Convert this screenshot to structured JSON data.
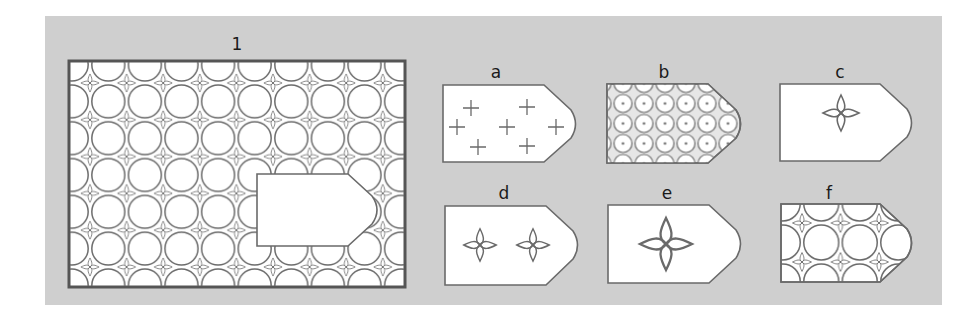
{
  "puzzle": {
    "type": "pattern-completion",
    "background_color": "#cfcfcf",
    "line_color": "#6a6a6a",
    "main_figure": {
      "label": "1",
      "description": "Rectangular tiled pattern of four-pointed stars joined by curved arcs forming circles; a white pentagon-shaped piece with a rounded tip is missing on the lower right",
      "grid_columns": 9,
      "grid_rows": 6
    },
    "options": [
      {
        "label": "a",
        "content": "seven plus-sign crosses"
      },
      {
        "label": "b",
        "content": "dense grid of small circles with center dots"
      },
      {
        "label": "c",
        "content": "single small four-pointed star, upper center"
      },
      {
        "label": "d",
        "content": "two small four-pointed stars side by side"
      },
      {
        "label": "e",
        "content": "single large four-pointed star, centered"
      },
      {
        "label": "f",
        "content": "pattern of stars and circular arcs matching the main figure"
      }
    ]
  }
}
